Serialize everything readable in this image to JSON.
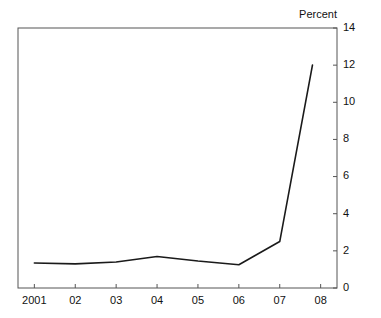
{
  "chart_data": {
    "type": "line",
    "title": "",
    "axis_title": "Percent",
    "xlabel": "",
    "ylabel": "Percent",
    "ylim": [
      0,
      14
    ],
    "yticks": [
      0,
      2,
      4,
      6,
      8,
      10,
      12,
      14
    ],
    "ytick_labels": [
      "0",
      "2",
      "4",
      "6",
      "8",
      "10",
      "12",
      "14"
    ],
    "y_axis_side": "right",
    "xlim": [
      2000.6,
      2008.4
    ],
    "xticks": [
      2001,
      2002,
      2003,
      2004,
      2005,
      2006,
      2007,
      2008
    ],
    "xtick_labels": [
      "2001",
      "02",
      "03",
      "04",
      "05",
      "06",
      "07",
      "08"
    ],
    "grid": false,
    "legend": null,
    "line_color": "#1a1a1a",
    "line_width": 1.6,
    "x": [
      2001,
      2002,
      2003,
      2004,
      2005,
      2006,
      2007,
      2007.8
    ],
    "values": [
      1.35,
      1.3,
      1.4,
      1.7,
      1.45,
      1.25,
      2.5,
      12.0
    ],
    "series": [
      {
        "name": "Percent",
        "x": [
          2001,
          2002,
          2003,
          2004,
          2005,
          2006,
          2007,
          2007.8
        ],
        "values": [
          1.35,
          1.3,
          1.4,
          1.7,
          1.45,
          1.25,
          2.5,
          12.0
        ]
      }
    ]
  },
  "figure": {
    "background": "#ffffff",
    "frame_color": "#555555"
  }
}
